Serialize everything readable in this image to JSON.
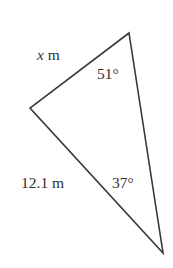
{
  "figure": {
    "type": "geometry-triangle-diagram",
    "background_color": "#ffffff",
    "stroke_color": "#3a3a3a",
    "stroke_width": 1.6,
    "text_color": "#303030",
    "canvas": {
      "width": 173,
      "height": 268
    }
  },
  "triangle": {
    "vertices": [
      {
        "name": "top",
        "x": 129,
        "y": 33
      },
      {
        "name": "left",
        "x": 30,
        "y": 108
      },
      {
        "name": "bottom",
        "x": 163,
        "y": 253
      }
    ],
    "path": "M 129 33 L 30 108 L 163 253 Z"
  },
  "labels": {
    "side_unknown": {
      "variable": "x",
      "unit": "m",
      "full_text": "x m"
    },
    "side_known": {
      "value": "12.1",
      "unit": "m",
      "full_text": "12.1 m"
    },
    "angle_top": {
      "value": "51",
      "symbol": "°",
      "full_text": "51°"
    },
    "angle_bottom": {
      "value": "37",
      "symbol": "°",
      "full_text": "37°"
    }
  }
}
